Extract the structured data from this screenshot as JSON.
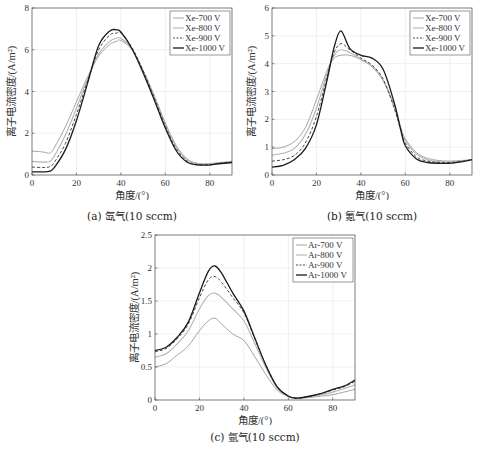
{
  "chart_data": [
    {
      "id": "a",
      "type": "line",
      "caption": "(a) 氙气(10 sccm)",
      "xlabel": "角度/(°)",
      "ylabel": "离子电流密度/(A/m²)",
      "xlim": [
        0,
        90
      ],
      "ylim": [
        0,
        8
      ],
      "xticks": [
        0,
        20,
        40,
        60,
        80
      ],
      "yticks": [
        0,
        2,
        4,
        6,
        8
      ],
      "ytick_labels": [
        "0",
        "2",
        "4",
        "6",
        "8"
      ],
      "grid": true,
      "legend_position": "upper right",
      "x": [
        0,
        5,
        8,
        10,
        15,
        20,
        25,
        30,
        35,
        38,
        40,
        45,
        50,
        55,
        60,
        65,
        70,
        75,
        80,
        85,
        90
      ],
      "series": [
        {
          "name": "Xe-700 V",
          "style": "solid-light",
          "values": [
            1.15,
            1.1,
            1.05,
            1.3,
            2.3,
            3.5,
            4.7,
            5.7,
            6.25,
            6.4,
            6.45,
            6.0,
            5.0,
            3.8,
            2.5,
            1.4,
            0.75,
            0.55,
            0.55,
            0.6,
            0.65
          ]
        },
        {
          "name": "Xe-800 V",
          "style": "solid-mid",
          "values": [
            0.65,
            0.62,
            0.65,
            0.9,
            1.9,
            3.2,
            4.6,
            5.8,
            6.4,
            6.55,
            6.55,
            6.05,
            5.0,
            3.8,
            2.45,
            1.35,
            0.72,
            0.53,
            0.53,
            0.58,
            0.62
          ]
        },
        {
          "name": "Xe-900 V",
          "style": "dashed",
          "values": [
            0.38,
            0.36,
            0.4,
            0.6,
            1.5,
            2.9,
            4.5,
            6.0,
            6.7,
            6.8,
            6.8,
            6.1,
            5.0,
            3.7,
            2.35,
            1.25,
            0.65,
            0.5,
            0.5,
            0.57,
            0.62
          ]
        },
        {
          "name": "Xe-1000 V",
          "style": "solid-dark",
          "values": [
            0.15,
            0.15,
            0.18,
            0.35,
            1.2,
            2.6,
            4.4,
            6.2,
            6.9,
            6.95,
            6.85,
            6.05,
            4.9,
            3.6,
            2.25,
            1.15,
            0.6,
            0.48,
            0.48,
            0.55,
            0.6
          ]
        }
      ]
    },
    {
      "id": "b",
      "type": "line",
      "caption": "(b) 氪气(10 sccm)",
      "xlabel": "角度/(°)",
      "ylabel": "离子电流密度/(A/m²)",
      "xlim": [
        0,
        90
      ],
      "ylim": [
        0,
        6
      ],
      "xticks": [
        0,
        20,
        40,
        60,
        80
      ],
      "yticks": [
        0,
        1,
        2,
        3,
        4,
        5,
        6
      ],
      "ytick_labels": [
        "0",
        "1",
        "2",
        "3",
        "4",
        "5",
        "6"
      ],
      "grid": true,
      "legend_position": "upper right",
      "x": [
        0,
        5,
        10,
        15,
        20,
        25,
        28,
        31,
        35,
        40,
        45,
        50,
        55,
        58,
        60,
        65,
        70,
        75,
        80,
        85,
        90
      ],
      "series": [
        {
          "name": "Xe-700 V",
          "style": "solid-light",
          "values": [
            0.95,
            1.0,
            1.2,
            1.7,
            2.7,
            3.8,
            4.2,
            4.3,
            4.3,
            4.15,
            3.9,
            3.4,
            2.5,
            1.7,
            1.3,
            0.8,
            0.6,
            0.52,
            0.5,
            0.52,
            0.55
          ]
        },
        {
          "name": "Xe-800 V",
          "style": "solid-mid",
          "values": [
            0.72,
            0.78,
            0.95,
            1.45,
            2.4,
            3.7,
            4.3,
            4.5,
            4.4,
            4.15,
            3.9,
            3.4,
            2.45,
            1.65,
            1.25,
            0.75,
            0.55,
            0.48,
            0.47,
            0.5,
            0.55
          ]
        },
        {
          "name": "Xe-900 V",
          "style": "dashed",
          "values": [
            0.5,
            0.55,
            0.7,
            1.15,
            2.1,
            3.6,
            4.4,
            4.72,
            4.5,
            4.2,
            3.95,
            3.45,
            2.4,
            1.6,
            1.15,
            0.65,
            0.5,
            0.45,
            0.45,
            0.48,
            0.55
          ]
        },
        {
          "name": "Xe-1000 V",
          "style": "solid-dark",
          "values": [
            0.28,
            0.35,
            0.55,
            0.95,
            1.8,
            3.5,
            4.6,
            5.18,
            4.55,
            4.3,
            4.2,
            3.8,
            2.6,
            1.6,
            1.05,
            0.58,
            0.45,
            0.42,
            0.42,
            0.47,
            0.55
          ]
        }
      ]
    },
    {
      "id": "c",
      "type": "line",
      "caption": "(c) 氩气(10 sccm)",
      "xlabel": "角度/(°)",
      "ylabel": "离子电流密度/(A/m²)",
      "xlim": [
        0,
        90
      ],
      "ylim": [
        0,
        2.5
      ],
      "xticks": [
        0,
        20,
        40,
        60,
        80
      ],
      "yticks": [
        0,
        0.5,
        1,
        1.5,
        2,
        2.5
      ],
      "ytick_labels": [
        "0",
        "0.5",
        "1",
        "1.5",
        "2",
        "2.5"
      ],
      "grid": true,
      "legend_position": "upper right",
      "x": [
        0,
        5,
        10,
        15,
        20,
        24,
        27,
        30,
        35,
        40,
        45,
        50,
        55,
        60,
        63,
        65,
        70,
        75,
        80,
        85,
        90
      ],
      "series": [
        {
          "name": "Ar-700 V",
          "style": "solid-light",
          "values": [
            0.5,
            0.55,
            0.68,
            0.82,
            1.05,
            1.2,
            1.24,
            1.15,
            1.0,
            0.9,
            0.65,
            0.38,
            0.15,
            0.05,
            0.03,
            0.03,
            0.04,
            0.06,
            0.08,
            0.12,
            0.16
          ]
        },
        {
          "name": "Ar-800 V",
          "style": "solid-mid",
          "values": [
            0.65,
            0.7,
            0.85,
            1.05,
            1.38,
            1.58,
            1.62,
            1.55,
            1.38,
            1.2,
            0.85,
            0.48,
            0.18,
            0.05,
            0.03,
            0.03,
            0.05,
            0.08,
            0.12,
            0.17,
            0.23
          ]
        },
        {
          "name": "Ar-900 V",
          "style": "dashed",
          "values": [
            0.73,
            0.78,
            0.93,
            1.15,
            1.55,
            1.82,
            1.87,
            1.78,
            1.55,
            1.32,
            0.92,
            0.52,
            0.2,
            0.06,
            0.03,
            0.03,
            0.06,
            0.1,
            0.15,
            0.2,
            0.28
          ]
        },
        {
          "name": "Ar-1000 V",
          "style": "solid-dark",
          "values": [
            0.75,
            0.8,
            0.95,
            1.18,
            1.62,
            1.95,
            2.03,
            1.92,
            1.62,
            1.35,
            0.93,
            0.52,
            0.2,
            0.06,
            0.03,
            0.03,
            0.06,
            0.1,
            0.16,
            0.21,
            0.3
          ]
        }
      ]
    }
  ],
  "colors": {
    "solid-light": "#9a9a9a",
    "solid-mid": "#b4b4b4",
    "dashed": "#333333",
    "solid-dark": "#1a1a1a",
    "axis": "#444444",
    "grid": "#e6e6e6"
  }
}
